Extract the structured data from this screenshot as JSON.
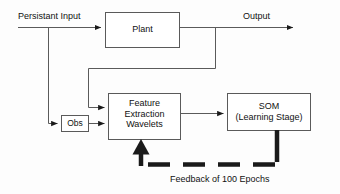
{
  "diagram": {
    "background_color": "#fdfdfd",
    "line_color": "#555555",
    "thick_color": "#111111",
    "text_color": "#111111",
    "blocks": [
      {
        "id": "plant",
        "label": "Plant",
        "x": 105,
        "y": 12,
        "w": 75,
        "h": 36
      },
      {
        "id": "obs",
        "label": "Obs",
        "x": 61,
        "y": 115,
        "w": 28,
        "h": 17
      },
      {
        "id": "features",
        "label": "Feature\nExtraction\nWavelets",
        "x": 108,
        "y": 93,
        "w": 73,
        "h": 47
      },
      {
        "id": "som",
        "label": "SOM\n(Learning Stage)",
        "x": 227,
        "y": 93,
        "w": 84,
        "h": 38
      }
    ],
    "labels": {
      "input": "Persistant Input",
      "output": "Output",
      "feedback": "Feedback of 100 Epochs"
    },
    "connections": [
      {
        "id": "input-to-plant",
        "from": "input-source",
        "to": "plant",
        "style": "solid-arrow"
      },
      {
        "id": "input-branch-obs",
        "from": "input-line",
        "to": "obs",
        "style": "solid-arrow"
      },
      {
        "id": "plant-to-output",
        "from": "plant",
        "to": "output",
        "style": "solid-arrow"
      },
      {
        "id": "plant-to-features",
        "from": "plant",
        "to": "features",
        "style": "solid-arrow"
      },
      {
        "id": "obs-to-features",
        "from": "obs",
        "to": "features",
        "style": "solid-arrow"
      },
      {
        "id": "features-to-som",
        "from": "features",
        "to": "som",
        "style": "solid-arrow"
      },
      {
        "id": "som-feedback",
        "from": "som",
        "to": "features",
        "style": "thick-dashed-arrow"
      }
    ]
  }
}
